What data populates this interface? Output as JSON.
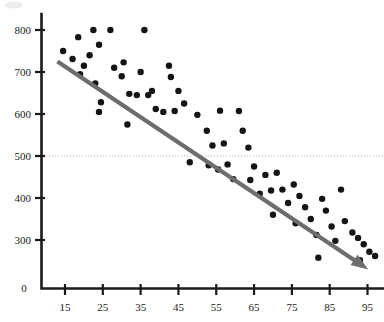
{
  "chart_data": {
    "type": "scatter",
    "title": "",
    "xlabel": "",
    "ylabel": "",
    "xlim": [
      10,
      100
    ],
    "ylim": [
      200,
      830
    ],
    "grid": false,
    "legend": null,
    "x_ticks": [
      15,
      25,
      35,
      45,
      55,
      65,
      75,
      85,
      95
    ],
    "x_tick_labels": [
      "15",
      "25",
      "35",
      "45",
      "55",
      "65",
      "75",
      "85",
      "95"
    ],
    "y_ticks": [
      300,
      400,
      500,
      600,
      700,
      800
    ],
    "y_tick_labels": [
      "300",
      "400",
      "500",
      "600",
      "700",
      "800"
    ],
    "origin_label": "0",
    "reference_line": {
      "orientation": "horizontal",
      "value": 500,
      "style": "dotted",
      "color": "#b9b4bd"
    },
    "trend_line": {
      "style": "solid-arrow",
      "color": "#6d6d6d",
      "start": [
        13.0,
        725
      ],
      "end": [
        95.2,
        230
      ],
      "slope": -6.03,
      "intercept": 803.4,
      "arrow_at_end": true
    },
    "marker": {
      "shape": "circle",
      "color": "#141414",
      "size_px": 3.2
    },
    "points": [
      [
        14.5,
        750
      ],
      [
        18.5,
        783
      ],
      [
        22.5,
        800
      ],
      [
        17.0,
        731
      ],
      [
        20.0,
        715
      ],
      [
        19.0,
        695
      ],
      [
        21.5,
        740
      ],
      [
        24.0,
        765
      ],
      [
        23.0,
        673
      ],
      [
        24.5,
        628
      ],
      [
        24.0,
        605
      ],
      [
        27.0,
        800
      ],
      [
        28.0,
        710
      ],
      [
        30.5,
        723
      ],
      [
        30.0,
        690
      ],
      [
        32.0,
        648
      ],
      [
        34.0,
        645
      ],
      [
        31.5,
        575
      ],
      [
        36.0,
        800
      ],
      [
        35.0,
        700
      ],
      [
        37.0,
        645
      ],
      [
        38.0,
        655
      ],
      [
        39.0,
        612
      ],
      [
        41.0,
        605
      ],
      [
        42.5,
        715
      ],
      [
        43.0,
        688
      ],
      [
        45.0,
        655
      ],
      [
        44.0,
        607
      ],
      [
        46.5,
        625
      ],
      [
        48.0,
        485
      ],
      [
        50.0,
        598
      ],
      [
        52.5,
        560
      ],
      [
        54.0,
        525
      ],
      [
        53.0,
        478
      ],
      [
        55.5,
        468
      ],
      [
        57.0,
        530
      ],
      [
        58.0,
        480
      ],
      [
        59.5,
        445
      ],
      [
        56.0,
        608
      ],
      [
        61.0,
        607
      ],
      [
        62.0,
        560
      ],
      [
        63.5,
        520
      ],
      [
        65.0,
        475
      ],
      [
        64.0,
        443
      ],
      [
        66.5,
        410
      ],
      [
        68.0,
        455
      ],
      [
        69.5,
        418
      ],
      [
        71.0,
        460
      ],
      [
        72.5,
        420
      ],
      [
        74.0,
        388
      ],
      [
        70.0,
        360
      ],
      [
        75.5,
        432
      ],
      [
        77.0,
        405
      ],
      [
        78.5,
        378
      ],
      [
        76.0,
        340
      ],
      [
        80.0,
        350
      ],
      [
        81.5,
        312
      ],
      [
        83.0,
        398
      ],
      [
        84.0,
        370
      ],
      [
        85.5,
        332
      ],
      [
        86.5,
        298
      ],
      [
        82.0,
        258
      ],
      [
        88.0,
        420
      ],
      [
        89.0,
        345
      ],
      [
        91.0,
        318
      ],
      [
        92.5,
        305
      ],
      [
        94.0,
        290
      ],
      [
        95.5,
        272
      ],
      [
        93.0,
        252
      ],
      [
        97.0,
        262
      ]
    ]
  },
  "axes": {
    "y_axis_name": "value-axis",
    "x_axis_name": "category-axis"
  }
}
